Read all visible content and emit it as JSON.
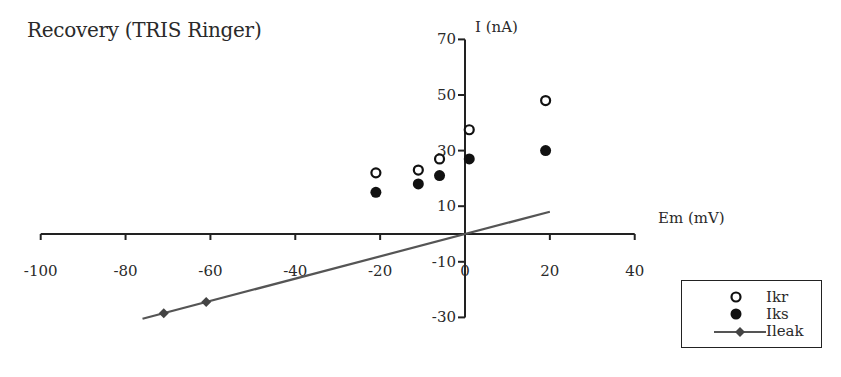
{
  "chart_data": {
    "type": "scatter",
    "title": "Recovery  (TRIS Ringer)",
    "xlabel": "Em (mV)",
    "ylabel": "I (nA)",
    "xlim": [
      -100,
      40
    ],
    "ylim": [
      -30,
      70
    ],
    "x_ticks": [
      -100,
      -80,
      -60,
      -40,
      -20,
      0,
      20,
      40
    ],
    "x_tick_labels": [
      "-100",
      "-80",
      "-60",
      "-40",
      "-20",
      "0",
      "20",
      "40"
    ],
    "y_ticks": [
      70,
      50,
      30,
      10,
      -10,
      -30
    ],
    "y_tick_labels": [
      "70",
      "50",
      "30",
      "10",
      "-10",
      "-30"
    ],
    "grid": false,
    "legend_position": "lower right",
    "series": [
      {
        "name": "Ikr",
        "marker": "open-circle",
        "x": [
          -21,
          -11,
          -6,
          1,
          19
        ],
        "y": [
          22,
          23,
          27,
          37.5,
          48
        ]
      },
      {
        "name": "Iks",
        "marker": "filled-circle",
        "x": [
          -21,
          -11,
          -6,
          1,
          19
        ],
        "y": [
          15,
          18,
          21,
          27,
          30
        ]
      },
      {
        "name": "Ileak",
        "marker": "diamond-line",
        "points_x": [
          -71,
          -61
        ],
        "points_y": [
          -28.5,
          -24.5
        ],
        "line_x": [
          -76,
          20
        ],
        "line_y": [
          -30.5,
          8
        ]
      }
    ],
    "colors": {
      "axis": "#222222",
      "Ikr": "#111111",
      "Iks": "#111111",
      "Ileak": "#555555",
      "Ileak_marker": "#444444"
    }
  },
  "legend": {
    "items": [
      {
        "label": "Ikr"
      },
      {
        "label": "Iks"
      },
      {
        "label": "Ileak"
      }
    ]
  }
}
